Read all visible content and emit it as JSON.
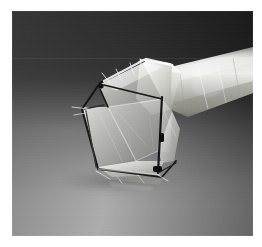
{
  "image": {
    "kind": "photograph",
    "subject": "self-expanding polygonal stent frame with translucent membrane on a tapered catheter shaft",
    "caption": "",
    "orientation": "landscape",
    "width_px": 262,
    "height_px": 247
  },
  "frame": {
    "matte_color": "#ffffff",
    "matte_left_px": 12,
    "matte_top_px": 11,
    "photo_width_px": 241,
    "photo_height_px": 225
  },
  "backdrop": {
    "type": "studio seamless sweep",
    "top_color": "#2f2f2f",
    "upper_right_color": "#1a1a1a",
    "mid_color": "#6b6b6b",
    "bottom_color": "#dedede",
    "gradient_direction": "dark top to light bottom",
    "has_seam_line": true,
    "seam_position_pct": 21
  },
  "subject": {
    "membrane": {
      "label": "translucent membrane",
      "highlight_color": "#f2f2ee",
      "mid_color": "#c8c8c2",
      "shade_color": "#8e8e88",
      "edge_color": "#fbfbf8"
    },
    "struts": {
      "label": "dark wire struts",
      "color": "#161616",
      "secondary_color": "#3a3a3a",
      "count": 9
    },
    "marker_beads": {
      "label": "radiopaque marker beads",
      "color": "#0d0d0d",
      "count": 3
    },
    "shaft": {
      "label": "tapered catheter shaft",
      "highlight_color": "#e8e8e4",
      "body_color": "#b4b4ae",
      "shade_color": "#7d7d78",
      "direction": "extends to upper right"
    },
    "shadow": {
      "label": "contact shadow",
      "color": "#464646"
    }
  }
}
